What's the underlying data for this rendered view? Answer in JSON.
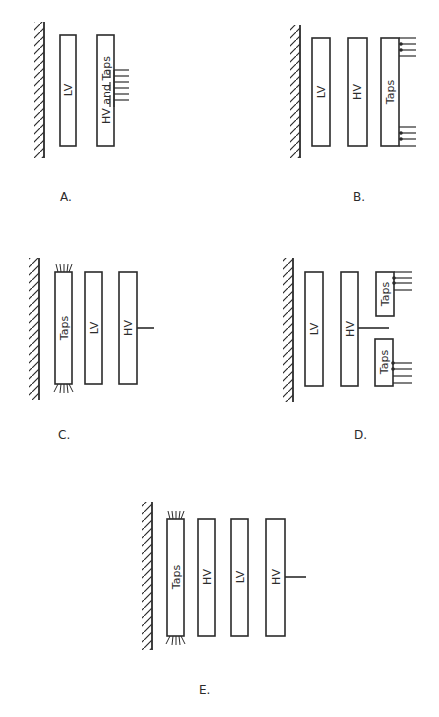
{
  "figure": {
    "type": "transformer winding arrangements",
    "ink_color": "#2b2b2b",
    "background": "#ffffff"
  },
  "diagrams": {
    "a": {
      "caption": "A.",
      "windings": [
        "LV",
        "HV and Taps"
      ],
      "tap_leads": 6,
      "tap_position": "middle of outer HV winding"
    },
    "b": {
      "caption": "B.",
      "windings": [
        "LV",
        "HV",
        "Taps"
      ],
      "tap_leads_top": 3,
      "tap_leads_bottom": 3
    },
    "c": {
      "caption": "C.",
      "windings": [
        "Taps",
        "LV",
        "HV"
      ],
      "hv_lead": "center line terminal"
    },
    "d": {
      "caption": "D.",
      "windings": [
        "LV",
        "HV",
        "Taps",
        "Taps"
      ],
      "tap_leads_upper": 3,
      "tap_leads_lower": 4,
      "hv_lead": "center line terminal"
    },
    "e": {
      "caption": "E.",
      "windings": [
        "Taps",
        "HV",
        "LV",
        "HV"
      ],
      "hv_lead": "center line terminal"
    }
  }
}
